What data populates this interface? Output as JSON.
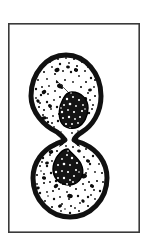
{
  "figure": {
    "caption": "",
    "kind": "scientific-line-art",
    "subject": "dividing cell in cytokinesis",
    "background_color": "#ffffff",
    "ink_color": "#111111",
    "frame": {
      "name": "illustration-border",
      "stroke_color": "#3a3a3a",
      "stroke_width": 1.6,
      "x": 8,
      "y": 23,
      "width": 132,
      "height": 210
    },
    "canvas": {
      "width": 149,
      "height": 250
    },
    "parts": [
      {
        "id": "upper-daughter-cell",
        "label": "Upper daughter cell",
        "shape": "ellipse",
        "cx": 66,
        "cy": 97,
        "rx": 35,
        "ry": 42,
        "membrane_width": 5,
        "fill": "#ffffff"
      },
      {
        "id": "lower-daughter-cell",
        "label": "Lower daughter cell",
        "shape": "ellipse",
        "cx": 70,
        "cy": 178,
        "rx": 37,
        "ry": 39,
        "membrane_width": 5,
        "fill": "#ffffff"
      },
      {
        "id": "cleavage-furrow",
        "label": "Cleavage furrow / isthmus",
        "shape": "waist",
        "cx": 68,
        "cy": 139,
        "neck_half_width": 7
      },
      {
        "id": "upper-nucleus",
        "label": "Upper nucleus",
        "cx": 73,
        "cy": 110,
        "rx": 14,
        "ry": 18,
        "fill": "#141414"
      },
      {
        "id": "lower-nucleus",
        "label": "Lower nucleus",
        "cx": 68,
        "cy": 166,
        "rx": 14,
        "ry": 17,
        "fill": "#141414"
      }
    ],
    "texture": {
      "stipple_dot_color": "#111111",
      "granule_color": "#0b0b0b",
      "nucleus_speckle_color": "#ffffff"
    }
  }
}
